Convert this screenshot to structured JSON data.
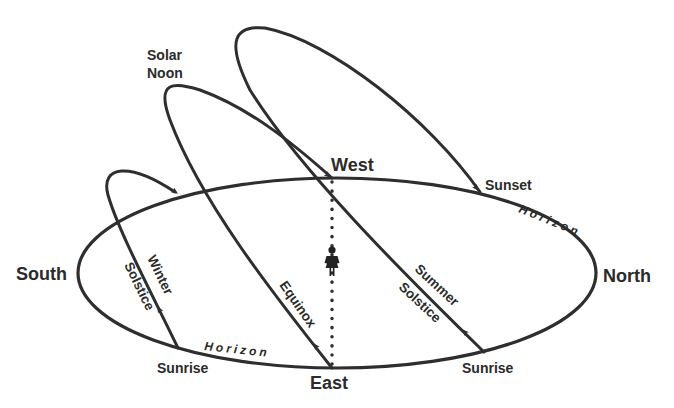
{
  "diagram": {
    "directions": {
      "west": "West",
      "east": "East",
      "south": "South",
      "north": "North"
    },
    "horizon_labels": [
      "Horizon",
      "Horizon"
    ],
    "paths": [
      {
        "name": "Winter Solstice",
        "line1": "Winter",
        "line2": "Solstice",
        "rise_label": "Sunrise"
      },
      {
        "name": "Equinox",
        "line1": "Equinox"
      },
      {
        "name": "Summer Solstice",
        "line1": "Summer",
        "line2": "Solstice",
        "rise_label": "Sunrise",
        "set_label": "Sunset"
      }
    ],
    "solar_noon": {
      "line1": "Solar",
      "line2": "Noon"
    },
    "observer_icon": "person-icon",
    "colors": {
      "line": "#2e2e2e",
      "text": "#2b2b2b",
      "background": "#ffffff"
    }
  }
}
